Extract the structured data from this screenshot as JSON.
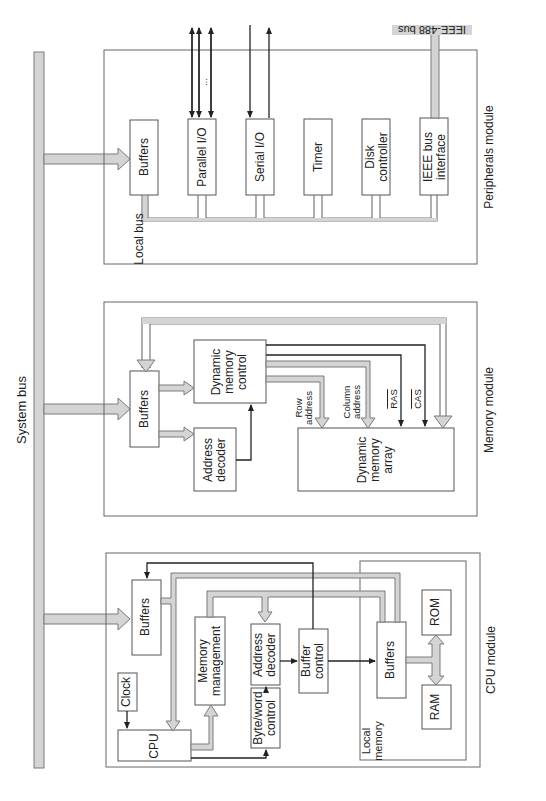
{
  "system_bus": {
    "label": "System bus"
  },
  "peripherals_module": {
    "title": "Peripherals module",
    "local_bus_label": "Local bus",
    "blocks": [
      {
        "id": "buffers",
        "label": "Buffers"
      },
      {
        "id": "parallel_io",
        "label": "Parallel I/O"
      },
      {
        "id": "serial_io",
        "label": "Serial I/O"
      },
      {
        "id": "timer",
        "label": "Timer"
      },
      {
        "id": "disk_controller",
        "label": "Disk\ncontroller"
      },
      {
        "id": "ieee_bus_interface",
        "label": "IEEE bus\ninterface"
      }
    ],
    "external_bus_label": "IEEE-488 bus",
    "parallel_ellipsis": "..."
  },
  "memory_module": {
    "title": "Memory module",
    "blocks": [
      {
        "id": "buffers",
        "label": "Buffers"
      },
      {
        "id": "dynamic_memory_control",
        "label": "Dynamic\nmemory\ncontrol"
      },
      {
        "id": "address_decoder",
        "label": "Address\ndecoder"
      },
      {
        "id": "dynamic_memory_array",
        "label": "Dynamic\nmemory\narray"
      }
    ],
    "signals": [
      {
        "id": "row_address",
        "label": "Row\naddress"
      },
      {
        "id": "column_address",
        "label": "Column\naddress"
      },
      {
        "id": "ras",
        "label": "RAS"
      },
      {
        "id": "cas",
        "label": "CAS"
      }
    ]
  },
  "cpu_module": {
    "title": "CPU module",
    "blocks": [
      {
        "id": "buffers",
        "label": "Buffers"
      },
      {
        "id": "clock",
        "label": "Clock"
      },
      {
        "id": "cpu",
        "label": "CPU"
      },
      {
        "id": "memory_management",
        "label": "Memory\nmanagement"
      },
      {
        "id": "address_decoder",
        "label": "Address\ndecoder"
      },
      {
        "id": "byte_word_control",
        "label": "Byte/word\ncontrol"
      },
      {
        "id": "buffer_control",
        "label": "Buffer\ncontrol"
      },
      {
        "id": "local_buffers",
        "label": "Buffers"
      },
      {
        "id": "rom",
        "label": "ROM"
      },
      {
        "id": "ram",
        "label": "RAM"
      }
    ],
    "local_memory_label": "Local\nmemory"
  },
  "colors": {
    "line": "#222222",
    "bus_fill": "#d4d4d4",
    "bus_stroke": "#7a7a7a",
    "box_stroke": "#555555"
  }
}
